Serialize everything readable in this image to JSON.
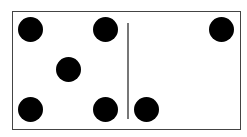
{
  "domino": {
    "left_half": {
      "value": 5
    },
    "right_half": {
      "value": 2
    },
    "colors": {
      "pip": "#000000",
      "border": "#444444",
      "divider": "#777777",
      "background": "#ffffff"
    }
  }
}
